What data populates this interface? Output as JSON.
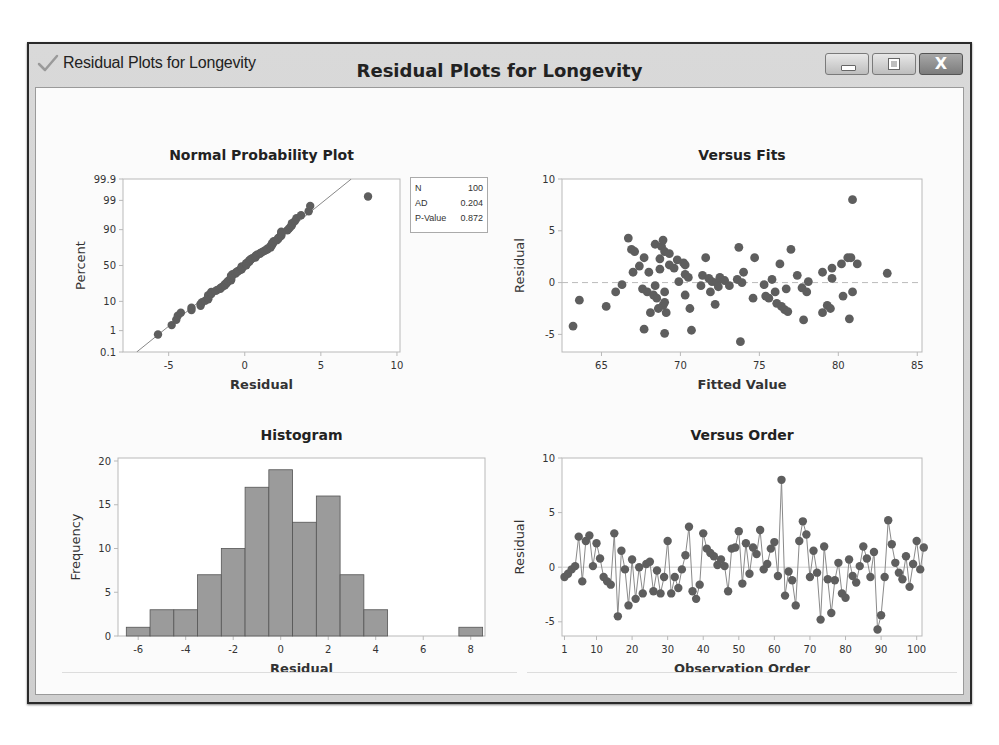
{
  "window": {
    "title": "Residual Plots for Longevity",
    "icon": "checkmark-icon",
    "controls": {
      "minimize": "minimize-icon",
      "maximize": "maximize-icon",
      "close": "close-icon",
      "close_glyph": "X"
    }
  },
  "main_title": "Residual Plots for Longevity",
  "stats": {
    "rows": [
      {
        "label": "N",
        "value": "100"
      },
      {
        "label": "AD",
        "value": "0.204"
      },
      {
        "label": "P-Value",
        "value": "0.872"
      }
    ]
  },
  "chart_data": [
    {
      "id": "npp",
      "type": "scatter",
      "title": "Normal Probability Plot",
      "xlabel": "Residual",
      "ylabel": "Percent",
      "xticks": [
        -5,
        0,
        5,
        10
      ],
      "yticks": [
        "0.1",
        "1",
        "10",
        "50",
        "90",
        "99",
        "99.9"
      ],
      "xlim": [
        -8,
        10.2
      ],
      "ylim_percent": [
        0.1,
        99.9
      ],
      "fit_line": {
        "x0": -7.1,
        "p0": 0.1,
        "x1": 7.0,
        "p1": 99.9
      },
      "stats": {
        "N": 100,
        "AD": 0.204,
        "P-Value": 0.872
      },
      "outlier": {
        "x": 8.1,
        "percent": 99.5
      }
    },
    {
      "id": "fits",
      "type": "scatter",
      "title": "Versus Fits",
      "xlabel": "Fitted Value",
      "ylabel": "Residual",
      "xticks": [
        65,
        70,
        75,
        80,
        85
      ],
      "yticks": [
        -5,
        0,
        5,
        10
      ],
      "xlim": [
        62.5,
        85.3
      ],
      "ylim": [
        -6.7,
        10
      ],
      "reference_line": 0,
      "points": [
        [
          63.2,
          -4.2
        ],
        [
          63.6,
          -1.7
        ],
        [
          65.3,
          -2.3
        ],
        [
          65.9,
          -0.9
        ],
        [
          66.3,
          -0.2
        ],
        [
          66.7,
          4.3
        ],
        [
          66.9,
          3.2
        ],
        [
          67.1,
          3.0
        ],
        [
          67.0,
          1.0
        ],
        [
          67.4,
          1.6
        ],
        [
          67.6,
          -0.6
        ],
        [
          67.7,
          2.4
        ],
        [
          67.7,
          -4.5
        ],
        [
          67.9,
          -0.9
        ],
        [
          68.0,
          1.0
        ],
        [
          68.1,
          -2.9
        ],
        [
          68.3,
          -1.2
        ],
        [
          68.4,
          3.7
        ],
        [
          68.4,
          -0.3
        ],
        [
          68.5,
          -1.5
        ],
        [
          68.6,
          -2.5
        ],
        [
          68.7,
          1.3
        ],
        [
          68.7,
          2.3
        ],
        [
          68.8,
          3.5
        ],
        [
          68.9,
          -2.2
        ],
        [
          68.9,
          4.1
        ],
        [
          69.0,
          3.0
        ],
        [
          69.0,
          -1.9
        ],
        [
          69.0,
          -0.9
        ],
        [
          69.0,
          -4.9
        ],
        [
          69.1,
          -2.9
        ],
        [
          69.3,
          2.8
        ],
        [
          69.3,
          1.7
        ],
        [
          69.6,
          1.4
        ],
        [
          69.8,
          2.2
        ],
        [
          69.9,
          0.1
        ],
        [
          70.2,
          1.9
        ],
        [
          70.3,
          1.7
        ],
        [
          70.3,
          0.8
        ],
        [
          70.3,
          -1.2
        ],
        [
          70.5,
          0.5
        ],
        [
          70.6,
          -2.5
        ],
        [
          70.7,
          -4.6
        ],
        [
          71.3,
          -0.3
        ],
        [
          71.4,
          0.7
        ],
        [
          71.6,
          2.4
        ],
        [
          71.8,
          0.4
        ],
        [
          71.9,
          -0.9
        ],
        [
          72.2,
          -2.1
        ],
        [
          72.0,
          0.1
        ],
        [
          72.3,
          0.0
        ],
        [
          72.4,
          -0.4
        ],
        [
          72.5,
          0.5
        ],
        [
          72.8,
          0.2
        ],
        [
          73.1,
          -0.3
        ],
        [
          73.6,
          0.3
        ],
        [
          73.7,
          3.4
        ],
        [
          73.8,
          -5.7
        ],
        [
          73.9,
          0.0
        ],
        [
          74.0,
          1.0
        ],
        [
          74.6,
          -1.5
        ],
        [
          74.7,
          2.4
        ],
        [
          75.3,
          -0.2
        ],
        [
          75.4,
          -1.3
        ],
        [
          75.6,
          -1.5
        ],
        [
          75.8,
          0.3
        ],
        [
          76.0,
          -0.9
        ],
        [
          76.1,
          -2.0
        ],
        [
          76.3,
          1.8
        ],
        [
          76.4,
          -2.3
        ],
        [
          76.6,
          -2.6
        ],
        [
          76.7,
          -0.6
        ],
        [
          76.8,
          -2.8
        ],
        [
          77.0,
          3.2
        ],
        [
          77.4,
          0.7
        ],
        [
          77.7,
          -0.5
        ],
        [
          77.8,
          -3.6
        ],
        [
          78.0,
          -0.9
        ],
        [
          78.1,
          0.1
        ],
        [
          79.0,
          1.0
        ],
        [
          79.0,
          -2.9
        ],
        [
          79.3,
          -2.2
        ],
        [
          79.5,
          -2.5
        ],
        [
          79.6,
          1.4
        ],
        [
          79.6,
          0.4
        ],
        [
          80.2,
          1.8
        ],
        [
          80.3,
          -1.3
        ],
        [
          80.6,
          2.4
        ],
        [
          80.7,
          -3.5
        ],
        [
          80.8,
          2.4
        ],
        [
          80.9,
          8.0
        ],
        [
          80.9,
          -0.9
        ],
        [
          81.2,
          1.8
        ],
        [
          83.1,
          0.9
        ]
      ]
    },
    {
      "id": "histogram",
      "type": "bar",
      "title": "Histogram",
      "xlabel": "Residual",
      "ylabel": "Frequency",
      "xticks": [
        -6,
        -4,
        -2,
        0,
        2,
        4,
        6,
        8
      ],
      "yticks": [
        0,
        5,
        10,
        15,
        20
      ],
      "bin_width": 1,
      "categories": [
        -6,
        -5,
        -4,
        -3,
        -2,
        -1,
        0,
        1,
        2,
        3,
        4,
        5,
        6,
        7,
        8
      ],
      "values": [
        1,
        3,
        3,
        7,
        10,
        17,
        19,
        13,
        16,
        7,
        3,
        0,
        0,
        0,
        1
      ],
      "xlim": [
        -6.85,
        8.6
      ],
      "ylim": [
        0,
        20
      ],
      "bar_color": "#9b9b9b"
    },
    {
      "id": "order",
      "type": "line",
      "title": "Versus Order",
      "xlabel": "Observation Order",
      "ylabel": "Residual",
      "xticks": [
        1,
        10,
        20,
        30,
        40,
        50,
        60,
        70,
        80,
        90,
        100
      ],
      "yticks": [
        -5,
        0,
        5,
        10
      ],
      "xlim": [
        0.3,
        101.5
      ],
      "ylim": [
        -6.3,
        10
      ],
      "reference_line": 0,
      "values": [
        -0.9,
        -0.6,
        -0.2,
        0.1,
        2.8,
        -1.3,
        2.4,
        2.9,
        0.1,
        2.2,
        0.8,
        -0.9,
        -1.3,
        -1.6,
        3.1,
        -4.5,
        1.5,
        -0.2,
        -3.5,
        0.7,
        -2.9,
        0.0,
        -2.4,
        0.3,
        0.5,
        -2.2,
        -0.3,
        -2.4,
        -0.9,
        2.4,
        -2.4,
        -0.9,
        -1.9,
        -0.2,
        1.1,
        3.7,
        -2.2,
        -2.9,
        -1.6,
        3.1,
        1.7,
        1.3,
        1.0,
        0.2,
        0.7,
        0.1,
        -2.2,
        1.7,
        1.8,
        3.3,
        -1.5,
        2.2,
        -0.6,
        1.8,
        1.2,
        3.4,
        -0.2,
        0.3,
        1.7,
        2.3,
        -0.8,
        8.0,
        -2.6,
        -0.4,
        -1.2,
        -3.5,
        2.4,
        4.2,
        3.0,
        -0.9,
        1.5,
        -0.5,
        -4.8,
        1.9,
        -1.1,
        -4.2,
        -1.2,
        0.4,
        -2.4,
        -2.8,
        0.7,
        -0.8,
        -1.4,
        0.1,
        1.9,
        0.8,
        -0.9,
        1.4,
        -5.7,
        -4.4,
        -0.9,
        4.3,
        2.1,
        0.4,
        -0.5,
        -1.1,
        1.0,
        -1.8,
        0.3,
        2.4,
        -0.2,
        1.8
      ]
    }
  ]
}
